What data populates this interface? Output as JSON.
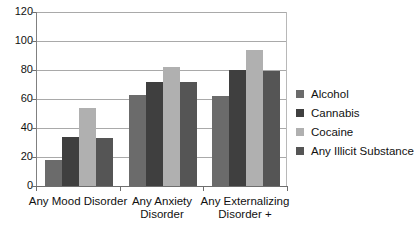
{
  "chart_data": {
    "type": "bar",
    "title": "",
    "subtitle": "",
    "xlabel": "",
    "ylabel": "",
    "ylim": [
      0,
      120
    ],
    "yticks": [
      0,
      20,
      40,
      60,
      80,
      100,
      120
    ],
    "ytick_labels": [
      "0",
      "20",
      "40",
      "60",
      "80",
      "100",
      "120"
    ],
    "grid": true,
    "legend_position": "right",
    "categories": [
      "Any Mood Disorder",
      "Any Anxiety Disorder",
      "Any Externalizing Disorder  +"
    ],
    "category_lines": [
      [
        "Any Mood Disorder"
      ],
      [
        "Any Anxiety",
        "Disorder"
      ],
      [
        "Any Externalizing",
        "Disorder  +"
      ]
    ],
    "series": [
      {
        "name": "Alcohol",
        "color": "#6b6b6b",
        "values": [
          18,
          63,
          62
        ]
      },
      {
        "name": "Cannabis",
        "color": "#3f3f3f",
        "values": [
          34,
          72,
          80
        ]
      },
      {
        "name": "Cocaine",
        "color": "#b0b0b0",
        "values": [
          54,
          82,
          94
        ]
      },
      {
        "name": "Any Illicit Substance",
        "color": "#555555",
        "values": [
          33,
          72,
          79
        ]
      }
    ]
  },
  "colors": {
    "gridline": "#a9a9a9",
    "axis": "#6e6e6e",
    "text": "#111111",
    "background": "#ffffff"
  }
}
